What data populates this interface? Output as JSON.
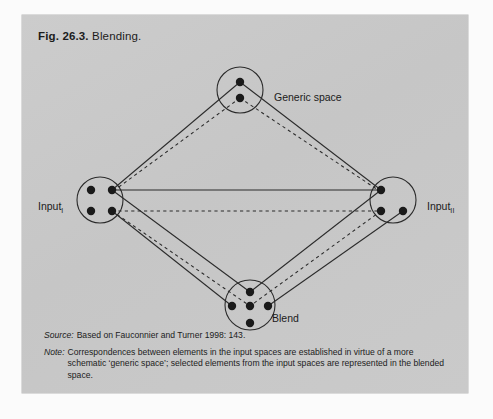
{
  "figure": {
    "number": "Fig. 26.3.",
    "title": "Blending."
  },
  "nodes": {
    "generic": {
      "label": "Generic space",
      "dots": 2
    },
    "input_1": {
      "label": "Input",
      "subscript": "I",
      "dots": 4
    },
    "input_2": {
      "label": "Input",
      "subscript": "II",
      "dots": 3
    },
    "blend": {
      "label": "Blend",
      "dots": 5
    }
  },
  "notes": {
    "source_key": "Source:",
    "source_text": "Based on Fauconnier and Turner 1998: 143.",
    "note_key": "Note:",
    "note_text": "Correspondences between elements in the input spaces are established in virtue of a more schematic ‘generic space’; selected elements from the input spaces are represented in the blended space."
  },
  "colors": {
    "panel_background": "#c9c9c9",
    "page_background": "#fdfdfd",
    "ink": "#1c1c1c",
    "stroke": "#2b2b2b"
  },
  "diagram_data": {
    "type": "network-diagram",
    "description": "Conceptual blending network: two input spaces, a generic space above, and a blended space below, connected by solid projection lines and dashed cross-space mapping lines.",
    "circles": [
      {
        "id": "generic",
        "cx": 218,
        "cy": 75,
        "r": 23
      },
      {
        "id": "input_1",
        "cx": 78,
        "cy": 185,
        "r": 23
      },
      {
        "id": "input_2",
        "cx": 371,
        "cy": 185,
        "r": 23
      },
      {
        "id": "blend",
        "cx": 228,
        "cy": 290,
        "r": 25
      }
    ],
    "points": [
      {
        "id": "g_top",
        "x": 218,
        "y": 67
      },
      {
        "id": "g_bot",
        "x": 218,
        "y": 83
      },
      {
        "id": "i1_tl",
        "x": 69,
        "y": 175
      },
      {
        "id": "i1_tr",
        "x": 90,
        "y": 175
      },
      {
        "id": "i1_bl",
        "x": 69,
        "y": 196
      },
      {
        "id": "i1_br",
        "x": 90,
        "y": 196
      },
      {
        "id": "i2_tl",
        "x": 359,
        "y": 175
      },
      {
        "id": "i2_bl",
        "x": 359,
        "y": 196
      },
      {
        "id": "i2_br",
        "x": 381,
        "y": 196
      },
      {
        "id": "b_top",
        "x": 228,
        "y": 277
      },
      {
        "id": "b_left",
        "x": 210,
        "y": 291
      },
      {
        "id": "b_mid",
        "x": 228,
        "y": 291
      },
      {
        "id": "b_right",
        "x": 246,
        "y": 291
      },
      {
        "id": "b_bot",
        "x": 228,
        "y": 308
      }
    ],
    "solid_edges": [
      [
        "g_top",
        "i1_tr"
      ],
      [
        "g_top",
        "i2_tl"
      ],
      [
        "i1_tr",
        "i2_tl"
      ],
      [
        "i1_tr",
        "b_top"
      ],
      [
        "i1_br",
        "b_left"
      ],
      [
        "i2_tl",
        "b_top"
      ],
      [
        "i2_br",
        "b_right"
      ]
    ],
    "dashed_edges": [
      [
        "g_bot",
        "i1_tr"
      ],
      [
        "g_bot",
        "i2_tl"
      ],
      [
        "i1_br",
        "i2_bl"
      ],
      [
        "i1_br",
        "b_mid"
      ],
      [
        "i2_bl",
        "b_mid"
      ]
    ]
  }
}
